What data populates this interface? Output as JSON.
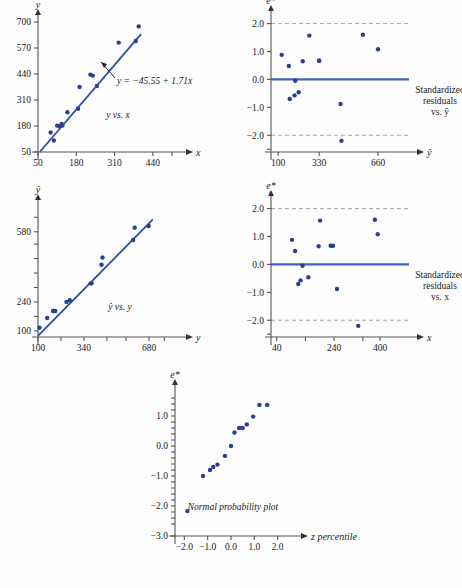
{
  "figure": {
    "dot_color": "#2b3f8f",
    "line_color": "#2b4ea8",
    "zero_line_color": "#3a63c0",
    "limit_line_color": "#9a9a9a",
    "background": "#fdfdfe"
  },
  "chart_data": [
    {
      "id": "y-vs-x",
      "type": "scatter",
      "title": "y vs. x",
      "xlabel": "x",
      "ylabel": "y",
      "xlim": [
        50,
        505
      ],
      "ylim": [
        50,
        700
      ],
      "xticks": [
        50,
        180,
        310,
        440
      ],
      "xticklabels": [
        "50",
        "180",
        "310",
        "440"
      ],
      "yticks": [
        50,
        180,
        310,
        440,
        570,
        700
      ],
      "yticklabels": [
        "50",
        "180",
        "310",
        "440",
        "570",
        "700"
      ],
      "grid": false,
      "annotation": "y = −45.55 + 1.71x",
      "fit_intercept": -45.55,
      "fit_slope": 1.71,
      "x": [
        93,
        104,
        115,
        123,
        130,
        133,
        150,
        186,
        191,
        228,
        236,
        250,
        324,
        382,
        392
      ],
      "y": [
        148,
        108,
        182,
        179,
        190,
        182,
        249,
        266,
        375,
        437,
        432,
        380,
        597,
        605,
        678
      ]
    },
    {
      "id": "residuals-vs-yhat",
      "type": "scatter",
      "title": "Standardized residuals vs. ŷ",
      "caption_lines": [
        "Standardized",
        "residuals",
        "vs. ŷ"
      ],
      "xlabel": "ŷ",
      "ylabel": "e*",
      "xlim": [
        60,
        800
      ],
      "ylim": [
        -2.6,
        2.2
      ],
      "xticks": [
        100,
        330,
        660
      ],
      "xticklabels": [
        "100",
        "330",
        "660"
      ],
      "yticks": [
        -2.0,
        -1.0,
        0.0,
        1.0,
        2.0
      ],
      "yticklabels": [
        "−2.0",
        "−1.0",
        "0.0",
        "1.0",
        "2.0"
      ],
      "grid": false,
      "reference_lines": [
        0.0
      ],
      "limit_lines": [
        2.0,
        -2.0
      ],
      "x": [
        120,
        160,
        165,
        192,
        196,
        215,
        238,
        275,
        330,
        330,
        450,
        455,
        575,
        660
      ],
      "y": [
        0.88,
        0.48,
        -0.7,
        -0.57,
        -0.05,
        -0.46,
        0.65,
        1.57,
        0.67,
        0.67,
        -0.88,
        -2.2,
        1.6,
        1.08
      ]
    },
    {
      "id": "yhat-vs-y",
      "type": "scatter",
      "title": "ŷ vs. y",
      "xlabel": "y",
      "ylabel": "ŷ",
      "xlim": [
        100,
        800
      ],
      "ylim": [
        70,
        700
      ],
      "xticks": [
        100,
        340,
        680
      ],
      "xticklabels": [
        "100",
        "340",
        "680"
      ],
      "yticks": [
        100,
        240,
        580
      ],
      "yticklabels": [
        "100",
        "240",
        "580"
      ],
      "grid": false,
      "x": [
        108,
        148,
        179,
        182,
        190,
        249,
        266,
        375,
        380,
        432,
        437,
        597,
        605,
        678
      ],
      "y": [
        115,
        162,
        196,
        196,
        196,
        240,
        248,
        330,
        330,
        420,
        455,
        540,
        600,
        608
      ]
    },
    {
      "id": "residuals-vs-x",
      "type": "scatter",
      "title": "Standardized residuals vs. x",
      "caption_lines": [
        "Standardized",
        "residuals",
        "vs. x"
      ],
      "xlabel": "x",
      "ylabel": "e*",
      "xlim": [
        20,
        480
      ],
      "ylim": [
        -2.6,
        2.2
      ],
      "xticks": [
        40,
        240,
        400
      ],
      "xticklabels": [
        "40",
        "240",
        "400"
      ],
      "yticks": [
        -2.0,
        -1.0,
        0.0,
        1.0,
        2.0
      ],
      "yticklabels": [
        "−2.0",
        "−1.0",
        "0.0",
        "1.0",
        "2.0"
      ],
      "grid": false,
      "reference_lines": [
        0.0
      ],
      "limit_lines": [
        2.0,
        -2.0
      ],
      "x": [
        93,
        104,
        115,
        123,
        130,
        150,
        186,
        191,
        228,
        236,
        250,
        324,
        382,
        392
      ],
      "y": [
        0.88,
        0.48,
        -0.7,
        -0.57,
        -0.05,
        -0.46,
        0.65,
        1.57,
        0.67,
        0.67,
        -0.88,
        -2.2,
        1.6,
        1.08
      ]
    },
    {
      "id": "normal-probability-plot",
      "type": "scatter",
      "title": "Normal probability plot",
      "xlabel": "z percentile",
      "ylabel": "e*",
      "xlim": [
        -2.4,
        2.4
      ],
      "ylim": [
        -3.0,
        1.8
      ],
      "xticks": [
        -2.0,
        -1.0,
        0.0,
        1.0,
        2.0
      ],
      "xticklabels": [
        "−2.0",
        "−1.0",
        "0.0",
        "1.0",
        "2.0"
      ],
      "yticks": [
        -3.0,
        -2.0,
        -1.0,
        0.0,
        1.0
      ],
      "yticklabels": [
        "−3.0",
        "−2.0",
        "−1.0",
        "0.0",
        "1.0"
      ],
      "grid": false,
      "x": [
        -1.87,
        -1.2,
        -0.9,
        -0.76,
        -0.58,
        -0.26,
        0.0,
        0.15,
        0.35,
        0.5,
        0.68,
        0.95,
        1.22,
        1.55
      ],
      "y": [
        -2.17,
        -1.0,
        -0.8,
        -0.7,
        -0.62,
        -0.33,
        0.0,
        0.45,
        0.6,
        0.6,
        0.72,
        0.98,
        1.37,
        1.37
      ]
    }
  ]
}
